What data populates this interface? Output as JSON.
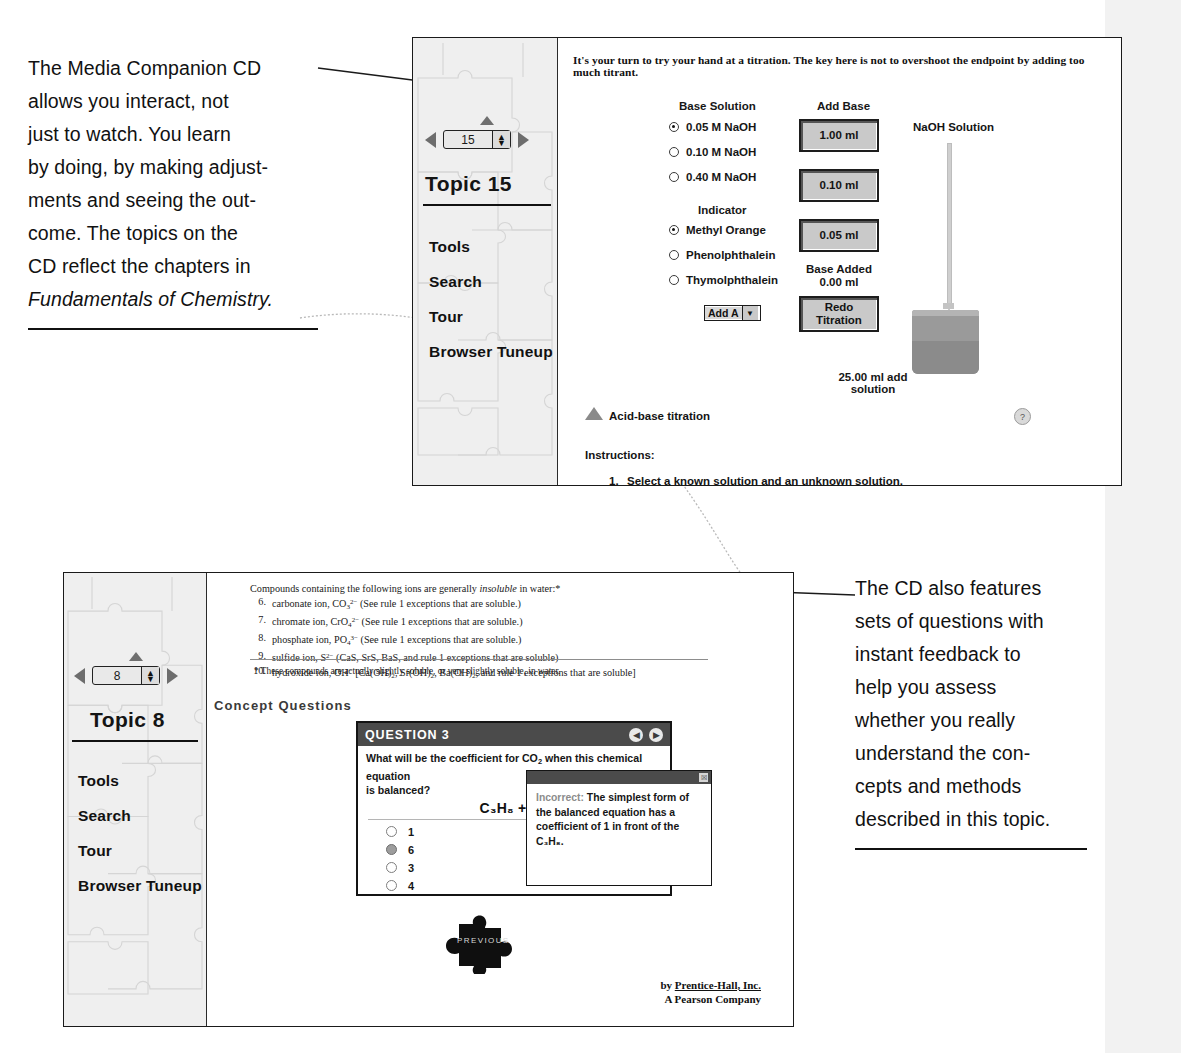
{
  "annotations": {
    "left": {
      "lines": [
        "The Media Companion CD",
        "allows you interact, not",
        "just to watch. You learn",
        "by doing, by making adjust-",
        "ments and seeing the out-",
        "come. The topics on the",
        "CD reflect the chapters in"
      ],
      "italic_line": "Fundamentals of Chemistry."
    },
    "right": {
      "lines": [
        "The CD also features",
        "sets of questions with",
        "instant feedback to",
        "help you assess",
        "whether you really",
        "understand the con-",
        "cepts and methods",
        "described in this topic."
      ]
    }
  },
  "top_window": {
    "sidebar": {
      "spinner_value": "15",
      "topic_title": "Topic 15",
      "links": [
        "Tools",
        "Search",
        "Tour",
        "Browser Tuneup"
      ]
    },
    "intro_text": "It's your turn to try your hand at a titration. The key here is not to overshoot the endpoint by adding too much titrant.",
    "base_solution": {
      "heading": "Base Solution",
      "options": [
        {
          "label": "0.05 M NaOH",
          "selected": true
        },
        {
          "label": "0.10 M NaOH",
          "selected": false
        },
        {
          "label": "0.40 M NaOH",
          "selected": false
        }
      ]
    },
    "indicator": {
      "heading": "Indicator",
      "options": [
        {
          "label": "Methyl Orange",
          "selected": true
        },
        {
          "label": "Phenolphthalein",
          "selected": false
        },
        {
          "label": "Thymolphthalein",
          "selected": false
        }
      ]
    },
    "add_base": {
      "heading": "Add Base",
      "buttons": [
        "1.00 ml",
        "0.10 ml",
        "0.05 ml"
      ],
      "base_added_label": "Base Added",
      "base_added_value": "0.00 ml",
      "redo_label_1": "Redo",
      "redo_label_2": "Titration"
    },
    "dropdown": {
      "value": "Add A"
    },
    "apparatus": {
      "burette_label": "NaOH Solution",
      "beaker_label_1": "25.00 ml add",
      "beaker_label_2": "solution"
    },
    "footer": {
      "titration_caption": "Acid-base titration",
      "instructions_heading": "Instructions:",
      "instruction_1_num": "1.",
      "instruction_1": "Select a known solution and an unknown solution.",
      "help_icon_glyph": "?"
    }
  },
  "bottom_window": {
    "sidebar": {
      "spinner_value": "8",
      "topic_title": "Topic 8",
      "links": [
        "Tools",
        "Search",
        "Tour",
        "Browser Tuneup"
      ]
    },
    "book_text": {
      "lead_a": "Compounds containing the following ions are generally ",
      "lead_italic": "insoluble",
      "lead_b": " in water:*",
      "items": [
        {
          "num": "6.",
          "html": "carbonate ion, CO<sub>3</sub><sup>2&#8722;</sup> (See rule 1 exceptions that are soluble.)"
        },
        {
          "num": "7.",
          "html": "chromate ion, CrO<sub>4</sub><sup>2&#8722;</sup> (See rule 1 exceptions that are soluble.)"
        },
        {
          "num": "8.",
          "html": "phosphate ion, PO<sub>4</sub><sup>3&#8722;</sup> (See rule 1 exceptions that are soluble.)"
        },
        {
          "num": "9.",
          "html": "sulfide ion, S<sup>2&#8722;</sup> (CaS, SrS, BaS, and rule 1 exceptions that are soluble)"
        },
        {
          "num": "10.",
          "html": "hydroxide ion, OH<sup>&#8722;</sup> [Ca(OH)<sub>2</sub>, Sr(OH)<sub>2</sub>, Ba(OH)<sub>2</sub>, and rule 1 exceptions that are soluble]"
        }
      ],
      "footnote": "* These compounds are actually slightly soluble, or very slightly soluble, in water."
    },
    "concept_questions_title": "Concept Questions",
    "question": {
      "header": "QUESTION 3",
      "prev_glyph": "◀",
      "next_glyph": "▶",
      "prompt_line_1": "What will be the coefficient for CO",
      "prompt_sub": "2",
      "prompt_line_1b": " when this chemical equation",
      "prompt_line_2": "is balanced?",
      "equation": "C₃H₈ + O₂",
      "options": [
        {
          "label": "1",
          "selected": false
        },
        {
          "label": "6",
          "selected": true
        },
        {
          "label": "3",
          "selected": false
        },
        {
          "label": "4",
          "selected": false
        }
      ]
    },
    "feedback_popup": {
      "close_glyph": "☒",
      "result": "Incorrect:",
      "text": " The simplest form of the balanced equation has a coefficient of 1 in front of the C₃H₈."
    },
    "previous_button_label": "PREVIOUS",
    "byline": {
      "by": "by ",
      "publisher": "Prentice-Hall, Inc.",
      "company": "A Pearson Company"
    }
  },
  "colors": {
    "sidebar_bg": "#efefef",
    "button_face": "#c9c9c9",
    "panel_header": "#4b4b4b",
    "accent_gray": "#8a8a8a"
  }
}
